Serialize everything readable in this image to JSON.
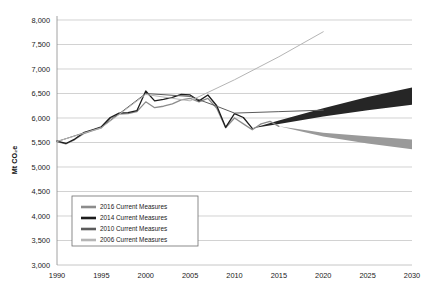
{
  "chart_data": {
    "type": "line",
    "title": "",
    "xlabel": "",
    "ylabel": "Mt CO2e",
    "ylabel_display": "Mt CO₂e",
    "xlim": [
      1990,
      2030
    ],
    "ylim": [
      3000,
      8000
    ],
    "ytick_step": 500,
    "xtick_step": 5,
    "grid": true,
    "legend_position": "lower-left-inside",
    "xticks": [
      "1990",
      "1995",
      "2000",
      "2005",
      "2010",
      "2015",
      "2020",
      "2025",
      "2030"
    ],
    "yticks": [
      "3,000",
      "3,500",
      "4,000",
      "4,500",
      "5,000",
      "5,500",
      "6,000",
      "6,500",
      "7,000",
      "7,500",
      "8,000"
    ],
    "series": [
      {
        "name": "2016 Current Measures",
        "color": "#8c8c8c",
        "kind": "line-with-band",
        "x": [
          1990,
          1991,
          1992,
          1993,
          1994,
          1995,
          1996,
          1997,
          1998,
          1999,
          2000,
          2001,
          2002,
          2003,
          2004,
          2005,
          2006,
          2007,
          2008,
          2009,
          2010,
          2011,
          2012,
          2013,
          2014,
          2015
        ],
        "values": [
          5520,
          5470,
          5560,
          5680,
          5740,
          5800,
          5990,
          6080,
          6090,
          6130,
          6330,
          6210,
          6240,
          6290,
          6370,
          6400,
          6330,
          6400,
          6200,
          5800,
          6000,
          5880,
          5760,
          5880,
          5930,
          5830
        ],
        "band_x": [
          2015,
          2020,
          2025,
          2030
        ],
        "band_upper": [
          5830,
          5700,
          5630,
          5560
        ],
        "band_lower": [
          5830,
          5620,
          5480,
          5360
        ],
        "band_color": "#9a9a9a"
      },
      {
        "name": "2014 Current Measures",
        "color": "#1c1c1c",
        "kind": "line-with-band",
        "x": [
          1990,
          1991,
          1992,
          1993,
          1994,
          1995,
          1996,
          1997,
          1998,
          1999,
          2000,
          2001,
          2002,
          2003,
          2004,
          2005,
          2006,
          2007,
          2008,
          2009,
          2010,
          2011,
          2012
        ],
        "values": [
          5530,
          5480,
          5570,
          5700,
          5760,
          5820,
          6010,
          6100,
          6110,
          6150,
          6550,
          6350,
          6380,
          6420,
          6480,
          6470,
          6350,
          6470,
          6250,
          5810,
          6090,
          6010,
          5790
        ],
        "band_x": [
          2012,
          2015,
          2020,
          2025,
          2030
        ],
        "band_upper": [
          5790,
          5950,
          6200,
          6430,
          6620
        ],
        "band_lower": [
          5790,
          5880,
          6030,
          6160,
          6270
        ],
        "band_color": "#262626"
      },
      {
        "name": "2010 Current Measures",
        "color": "#5c5c5c",
        "kind": "line",
        "x": [
          1990,
          1995,
          2000,
          2005,
          2008,
          2010,
          2015,
          2020
        ],
        "values": [
          5520,
          5810,
          6500,
          6440,
          6240,
          6100,
          6130,
          6160
        ]
      },
      {
        "name": "2006 Current Measures",
        "color": "#b5b5b5",
        "kind": "line",
        "x": [
          1990,
          1995,
          2000,
          2005,
          2010,
          2015,
          2020
        ],
        "values": [
          5520,
          5800,
          6480,
          6350,
          6780,
          7250,
          7760
        ]
      }
    ],
    "legend": [
      {
        "label": "2016 Current Measures",
        "color": "#8c8c8c"
      },
      {
        "label": "2014 Current Measures",
        "color": "#1c1c1c"
      },
      {
        "label": "2010 Current Measures",
        "color": "#5c5c5c"
      },
      {
        "label": "2006 Current Measures",
        "color": "#b5b5b5"
      }
    ]
  },
  "style": {
    "background": "#ffffff",
    "grid_color": "#bfbfbf",
    "axis_text_color": "#1a1a1a",
    "legend_border": "#6e6e6e"
  }
}
